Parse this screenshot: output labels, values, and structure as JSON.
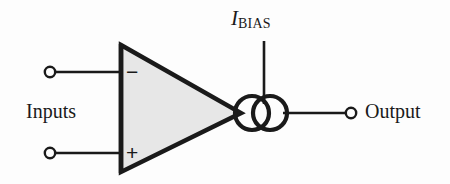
{
  "diagram": {
    "type": "operational-amplifier-circuit",
    "colors": {
      "stroke": "#1a1a1a",
      "amplifier_fill": "#e7e7e7",
      "background": "#fdfdfd"
    },
    "labels": {
      "inputs": "Inputs",
      "output": "Output",
      "bias_symbol": "I",
      "bias_subscript": "BIAS",
      "inverting_sign": "−",
      "noninverting_sign": "+"
    },
    "nodes": {
      "inverting_terminal": {
        "name": "inverting-input-terminal",
        "x": 50,
        "y": 72,
        "r": 5
      },
      "noninverting_terminal": {
        "name": "noninverting-input-terminal",
        "x": 50,
        "y": 153,
        "r": 5
      },
      "output_terminal": {
        "name": "output-terminal",
        "x": 351,
        "y": 113,
        "r": 5
      },
      "current_source_left": {
        "name": "current-source-circle-left",
        "x": 252,
        "y": 113,
        "r": 17
      },
      "current_source_right": {
        "name": "current-source-circle-right",
        "x": 270,
        "y": 113,
        "r": 17
      }
    },
    "amplifier": {
      "name": "amplifier-triangle",
      "left_x": 121,
      "top_y": 45,
      "bottom_y": 172,
      "apex_x": 241,
      "apex_y": 113
    },
    "wires": [
      {
        "name": "wire-inverting-input",
        "x1": 56,
        "y1": 72,
        "x2": 121,
        "y2": 72
      },
      {
        "name": "wire-noninverting-input",
        "x1": 56,
        "y1": 153,
        "x2": 121,
        "y2": 153
      },
      {
        "name": "wire-bias-vertical",
        "x1": 264,
        "y1": 41,
        "x2": 264,
        "y2": 100
      },
      {
        "name": "wire-output",
        "x1": 287,
        "y1": 113,
        "x2": 346,
        "y2": 113
      }
    ]
  }
}
